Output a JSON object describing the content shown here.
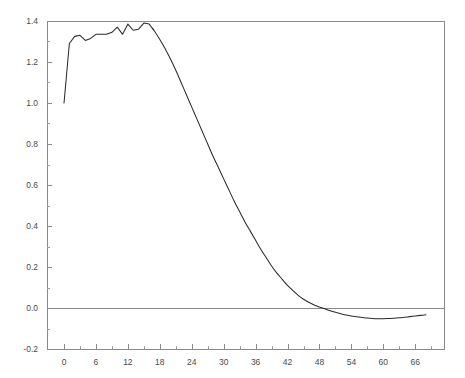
{
  "figure": {
    "background_color": "#ffffff",
    "width": 465,
    "height": 378
  },
  "chart_data": {
    "type": "line",
    "title": "",
    "subtitle": "",
    "xlabel": "",
    "ylabel": "",
    "xlim": [
      -3.2,
      71.4
    ],
    "ylim": [
      -0.2,
      1.4
    ],
    "grid": false,
    "legend": null,
    "legend_position": "none",
    "axis_color": "#8a8a8a",
    "line_color": "#2b2b2b",
    "zero_line": 0.0,
    "x_ticks": [
      0,
      6,
      12,
      18,
      24,
      30,
      36,
      42,
      48,
      54,
      60,
      66
    ],
    "x_tick_labels": [
      "0",
      "6",
      "12",
      "18",
      "24",
      "30",
      "36",
      "42",
      "48",
      "54",
      "60",
      "66"
    ],
    "x_minor_ticks": [
      3,
      9,
      15,
      21,
      27,
      33,
      39,
      45,
      51,
      57,
      63,
      69
    ],
    "y_ticks": [
      -0.2,
      0.0,
      0.2,
      0.4,
      0.6,
      0.8,
      1.0,
      1.2,
      1.4
    ],
    "y_tick_labels": [
      "-0.2",
      "0.0",
      "0.2",
      "0.4",
      "0.6",
      "0.8",
      "1.0",
      "1.2",
      "1.4"
    ],
    "y_minor_ticks": [
      -0.1,
      0.1,
      0.3,
      0.5,
      0.7,
      0.9,
      1.1,
      1.3
    ],
    "series": [
      {
        "name": "curve",
        "x": [
          0,
          1,
          2,
          3,
          4,
          5,
          6,
          7,
          8,
          9,
          10,
          11,
          12,
          13,
          14,
          15,
          16,
          17,
          18,
          19,
          20,
          21,
          22,
          23,
          24,
          25,
          26,
          27,
          28,
          29,
          30,
          31,
          32,
          33,
          34,
          35,
          36,
          37,
          38,
          39,
          40,
          41,
          42,
          43,
          44,
          45,
          46,
          47,
          48,
          49,
          50,
          51,
          52,
          53,
          54,
          55,
          56,
          57,
          58,
          59,
          60,
          61,
          62,
          63,
          64,
          65,
          66,
          67,
          68
        ],
        "values": [
          1.0,
          1.29,
          1.325,
          1.33,
          1.305,
          1.315,
          1.335,
          1.335,
          1.335,
          1.345,
          1.37,
          1.335,
          1.385,
          1.355,
          1.36,
          1.39,
          1.385,
          1.35,
          1.31,
          1.265,
          1.215,
          1.16,
          1.1,
          1.04,
          0.98,
          0.92,
          0.86,
          0.8,
          0.74,
          0.685,
          0.63,
          0.575,
          0.52,
          0.47,
          0.42,
          0.375,
          0.33,
          0.285,
          0.245,
          0.205,
          0.17,
          0.14,
          0.11,
          0.085,
          0.062,
          0.043,
          0.028,
          0.015,
          0.005,
          -0.004,
          -0.013,
          -0.021,
          -0.028,
          -0.034,
          -0.039,
          -0.043,
          -0.046,
          -0.049,
          -0.051,
          -0.052,
          -0.052,
          -0.051,
          -0.05,
          -0.048,
          -0.045,
          -0.042,
          -0.039,
          -0.036,
          -0.033
        ]
      }
    ]
  }
}
